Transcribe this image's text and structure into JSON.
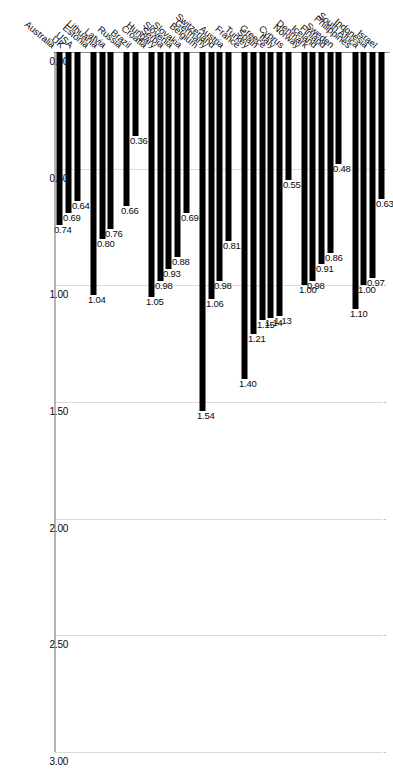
{
  "chart_data": {
    "type": "bar",
    "orientation": "horizontal",
    "title": "",
    "subtitle": "",
    "xlabel": "",
    "ylabel": "",
    "xlim": [
      0.0,
      3.0
    ],
    "xticks": [
      "0.00",
      "0.50",
      "1.00",
      "1.50",
      "2.00",
      "2.50",
      "3.00"
    ],
    "xtick_values": [
      0.0,
      0.5,
      1.0,
      1.5,
      2.0,
      2.5,
      3.0
    ],
    "grid": true,
    "grid_axis": "x",
    "legend": "none",
    "bar_color": "#000000",
    "value_label_format": "0.00",
    "categories": [
      "Israel",
      "Indonesia",
      "South Africa",
      "Philippines",
      "Sweden",
      "Finland",
      "Iceland",
      "Denmark",
      "Norway",
      "Cyprus",
      "Italy",
      "Greece",
      "Spain",
      "Turkey",
      "France",
      "Austria",
      "Switzerland",
      "Germany",
      "Belgium",
      "Slovakia",
      "Slovenia",
      "Serbia",
      "Hungary",
      "Croatia",
      "Brazil",
      "Russia",
      "Latvia",
      "Lithuania",
      "Estonia",
      "USA",
      "UK",
      "Australia"
    ],
    "values": [
      0.63,
      0.97,
      1.0,
      1.1,
      0.48,
      0.86,
      0.91,
      0.98,
      1.0,
      0.55,
      1.13,
      1.14,
      1.15,
      1.21,
      1.4,
      0.81,
      0.98,
      1.06,
      1.54,
      0.69,
      0.88,
      0.93,
      0.98,
      1.05,
      0.36,
      0.66,
      0.76,
      0.8,
      1.04,
      0.64,
      0.69,
      0.74
    ],
    "value_labels": [
      "0.63",
      "0.97",
      "1.00",
      "1.10",
      "0.48",
      "0.86",
      "0.91",
      "0.98",
      "1.00",
      "0.55",
      "1.13",
      "1.14",
      "1.15",
      "1.21",
      "1.40",
      "0.81",
      "0.98",
      "1.06",
      "1.54",
      "0.69",
      "0.88",
      "0.93",
      "0.98",
      "1.05",
      "0.36",
      "0.66",
      "0.76",
      "0.80",
      "1.04",
      "0.64",
      "0.69",
      "0.74"
    ],
    "groups": [
      {
        "name": "group-1",
        "categories": [
          "Israel",
          "Indonesia",
          "South Africa",
          "Philippines"
        ]
      },
      {
        "name": "group-2",
        "categories": [
          "Sweden",
          "Finland",
          "Iceland",
          "Denmark",
          "Norway"
        ]
      },
      {
        "name": "group-3",
        "categories": [
          "Cyprus",
          "Italy",
          "Greece",
          "Spain",
          "Turkey",
          "France"
        ]
      },
      {
        "name": "group-4",
        "categories": [
          "Austria",
          "Switzerland",
          "Germany",
          "Belgium"
        ]
      },
      {
        "name": "group-5",
        "categories": [
          "Slovakia",
          "Slovenia",
          "Serbia",
          "Hungary",
          "Croatia"
        ]
      },
      {
        "name": "group-6",
        "categories": [
          "Brazil",
          "Russia"
        ]
      },
      {
        "name": "group-7",
        "categories": [
          "Latvia",
          "Lithuania",
          "Estonia"
        ]
      },
      {
        "name": "group-8",
        "categories": [
          "USA",
          "UK",
          "Australia"
        ]
      }
    ]
  }
}
